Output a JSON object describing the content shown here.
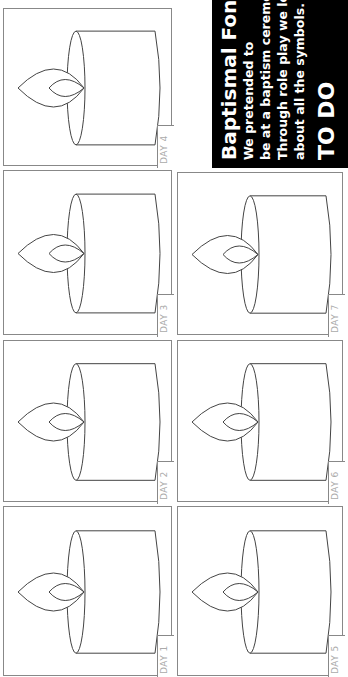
{
  "worksheet": {
    "title": "Baptismal Font",
    "lines": [
      "We pretended to",
      "be at a baptism ceremony.",
      "Through role play we learned",
      "about all the symbols."
    ],
    "todo": "TO DO"
  },
  "panels": [
    {
      "label": "DAY 4",
      "x": 3,
      "y": 8,
      "w": 169,
      "h": 158
    },
    {
      "label": "DAY 3",
      "x": 3,
      "y": 170,
      "w": 169,
      "h": 165
    },
    {
      "label": "DAY 2",
      "x": 3,
      "y": 340,
      "w": 169,
      "h": 162
    },
    {
      "label": "DAY 1",
      "x": 3,
      "y": 506,
      "w": 169,
      "h": 170
    },
    {
      "label": "DAY 7",
      "x": 177,
      "y": 172,
      "w": 166,
      "h": 163
    },
    {
      "label": "DAY 6",
      "x": 177,
      "y": 340,
      "w": 166,
      "h": 162
    },
    {
      "label": "DAY 5",
      "x": 177,
      "y": 506,
      "w": 166,
      "h": 170
    }
  ]
}
